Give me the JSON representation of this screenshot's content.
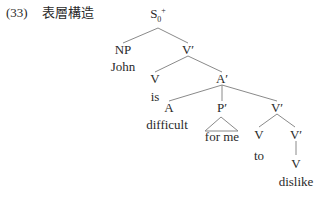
{
  "example": {
    "number": "(33)",
    "title": "表層構造"
  },
  "tree": {
    "nodes": {
      "S": {
        "label": "S",
        "sub": "0",
        "sup": "+"
      },
      "NP": {
        "label": "NP"
      },
      "John": {
        "label": "John"
      },
      "Vbar1": {
        "label": "V′"
      },
      "V1": {
        "label": "V"
      },
      "is": {
        "label": "is"
      },
      "Abar": {
        "label": "A′"
      },
      "A": {
        "label": "A"
      },
      "difficult": {
        "label": "difficult"
      },
      "Pbar": {
        "label": "P′"
      },
      "forme": {
        "label": "for me"
      },
      "Vbar2": {
        "label": "V′"
      },
      "V2": {
        "label": "V"
      },
      "to": {
        "label": "to"
      },
      "Vbar3": {
        "label": "V′"
      },
      "V3": {
        "label": "V"
      },
      "dislike": {
        "label": "dislike"
      }
    }
  }
}
